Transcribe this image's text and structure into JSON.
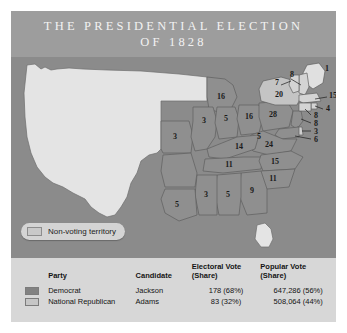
{
  "header": {
    "title": "THE PRESIDENTIAL ELECTION\nOF 1828"
  },
  "map": {
    "legend_pill": {
      "label": "Non-voting territory",
      "swatch_name": "non-voting-territory-swatch"
    },
    "colors": {
      "ocean": "#8b8b8b",
      "democrat": "#8f8f8f",
      "national_republican": "#d2d2d2",
      "non_voting": "#e3e3e3",
      "border": "#5e5e5e"
    },
    "state_labels": [
      {
        "state": "Maine",
        "value": "1",
        "party": "national-republican"
      },
      {
        "state": "New Hampshire",
        "value": "8",
        "party": "national-republican"
      },
      {
        "state": "Vermont",
        "value": "7",
        "party": "national-republican"
      },
      {
        "state": "Massachusetts",
        "value": "15",
        "party": "national-republican"
      },
      {
        "state": "Rhode Island",
        "value": "4",
        "party": "national-republican"
      },
      {
        "state": "Connecticut",
        "value": "8",
        "party": "national-republican"
      },
      {
        "state": "New York",
        "value": "20",
        "party": "democrat"
      },
      {
        "state": "New Jersey",
        "value": "8",
        "party": "democrat"
      },
      {
        "state": "Pennsylvania",
        "value": "28",
        "party": "democrat"
      },
      {
        "state": "Delaware",
        "value": "3",
        "party": "national-republican"
      },
      {
        "state": "Maryland",
        "value": "6",
        "party": "democrat"
      },
      {
        "state": "Virginia",
        "value": "24",
        "party": "democrat"
      },
      {
        "state": "North Carolina",
        "value": "15",
        "party": "democrat"
      },
      {
        "state": "South Carolina",
        "value": "11",
        "party": "democrat"
      },
      {
        "state": "Georgia",
        "value": "9",
        "party": "democrat"
      },
      {
        "state": "Ohio",
        "value": "16",
        "party": "democrat"
      },
      {
        "state": "Indiana",
        "value": "5",
        "party": "democrat"
      },
      {
        "state": "Illinois",
        "value": "3",
        "party": "democrat"
      },
      {
        "state": "Kentucky",
        "value": "14",
        "party": "democrat"
      },
      {
        "state": "Tennessee",
        "value": "11",
        "party": "democrat"
      },
      {
        "state": "Missouri",
        "value": "3",
        "party": "democrat"
      },
      {
        "state": "Mississippi",
        "value": "3",
        "party": "democrat"
      },
      {
        "state": "Alabama",
        "value": "5",
        "party": "democrat"
      },
      {
        "state": "Louisiana",
        "value": "5",
        "party": "democrat"
      },
      {
        "state": "Michigan area",
        "value": "16",
        "party": "democrat"
      },
      {
        "state": "West Virginia area",
        "value": "5",
        "party": "democrat"
      }
    ]
  },
  "results_table": {
    "columns": [
      {
        "key": "party",
        "label": "Party"
      },
      {
        "key": "candidate",
        "label": "Candidate"
      },
      {
        "key": "electoral",
        "label": "Electoral Vote\n(Share)"
      },
      {
        "key": "popular",
        "label": "Popular Vote\n(Share)"
      }
    ],
    "rows": [
      {
        "swatch": "democrat-swatch",
        "party": "Democrat",
        "candidate": "Jackson",
        "electoral": "178 (68%)",
        "popular": "647,286 (56%)"
      },
      {
        "swatch": "national-republican-swatch",
        "party": "National Republican",
        "candidate": "Adams",
        "electoral": "83 (32%)",
        "popular": "508,064 (44%)"
      }
    ]
  }
}
